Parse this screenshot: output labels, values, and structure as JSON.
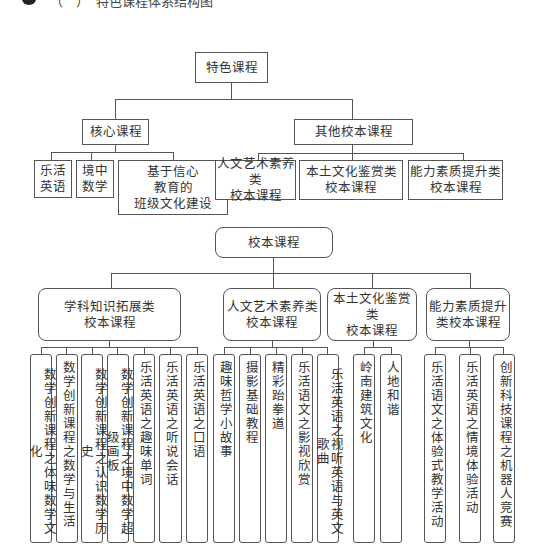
{
  "header": {
    "bullet_icon": "black-circle-bullet",
    "cut_off_heading": "（　）　特色课程体系结构图"
  },
  "diagram_top": {
    "root": "特色课程",
    "branches": [
      {
        "label": "核心课程",
        "children": [
          "乐活\n英语",
          "境中\n数学",
          "基于信心\n教育的\n班级文化建设"
        ]
      },
      {
        "label": "其他校本课程",
        "children": [
          "人文艺术素养类\n校本课程",
          "本土文化鉴赏类\n校本课程",
          "能力素质提升类\n校本课程"
        ]
      }
    ]
  },
  "diagram_bottom": {
    "root": "校本课程",
    "categories": [
      {
        "label": "学科知识拓展类\n校本课程",
        "leaves": [
          "数学创新课程之体味数学文化",
          "数学创新课程之数学与生活",
          "数学创新课程之认识数学历史",
          "数学创新课程之境中数学超级画板",
          "乐活英语之趣味单词",
          "乐活英语之听说会话",
          "乐活英语之口语"
        ]
      },
      {
        "label": "人文艺术素养类\n校本课程",
        "leaves": [
          "趣味哲学小故事",
          "摄影基础教程",
          "精彩跆拳道",
          "乐活语文之影视欣赏",
          "乐活英语之视听英语与英文歌曲"
        ]
      },
      {
        "label": "本土文化鉴赏类\n校本课程",
        "leaves": [
          "岭南建筑文化",
          "人地和谐"
        ]
      },
      {
        "label": "能力素质提升\n类校本课程",
        "leaves": [
          "乐活语文之体验式教学活动",
          "乐活英语之情境体验活动",
          "创新科技课程之机器人竞赛"
        ]
      }
    ]
  }
}
